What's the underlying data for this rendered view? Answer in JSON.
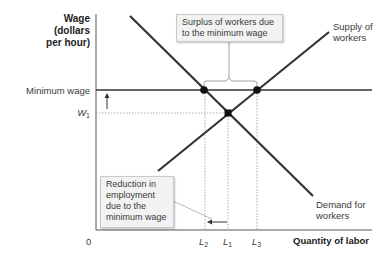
{
  "axes": {
    "y_title_line1": "Wage",
    "y_title_line2": "(dollars",
    "y_title_line3": "per hour)",
    "x_title": "Quantity of labor",
    "origin": "0"
  },
  "y_labels": {
    "minimum_wage": "Minimum wage",
    "w1_main": "W",
    "w1_sub": "1"
  },
  "x_labels": {
    "l2_main": "L",
    "l2_sub": "2",
    "l1_main": "L",
    "l1_sub": "1",
    "l3_main": "L",
    "l3_sub": "3"
  },
  "curves": {
    "supply_line1": "Supply of",
    "supply_line2": "workers",
    "demand_line1": "Demand for",
    "demand_line2": "workers"
  },
  "callouts": {
    "surplus_line1": "Surplus of workers due",
    "surplus_line2": "to the minimum wage",
    "reduction_line1": "Reduction in",
    "reduction_line2": "employment",
    "reduction_line3": "due to the",
    "reduction_line4": "minimum wage"
  },
  "colors": {
    "curve": "#333333",
    "axis": "#555555",
    "guide": "#999999",
    "callout_bg": "#f2f2f2"
  }
}
